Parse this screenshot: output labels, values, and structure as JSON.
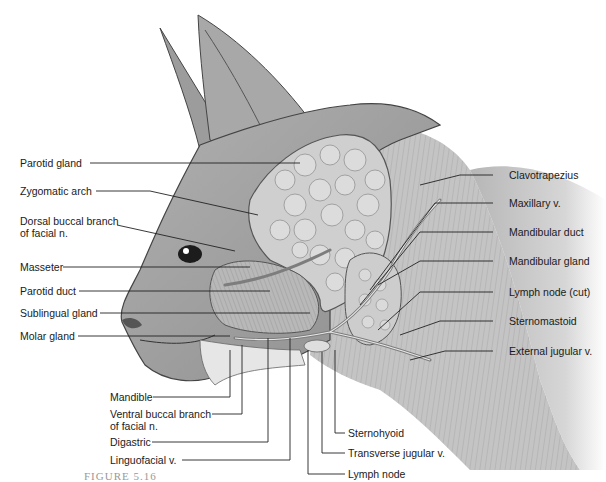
{
  "figure": {
    "caption_fragment": "FIGURE 5.16"
  },
  "labels_left": [
    {
      "id": "parotid-gland",
      "text": "Parotid gland"
    },
    {
      "id": "zygomatic-arch",
      "text": "Zygomatic arch"
    },
    {
      "id": "dorsal-buccal-branch",
      "line1": "Dorsal buccal branch",
      "line2": "of facial n."
    },
    {
      "id": "masseter",
      "text": "Masseter"
    },
    {
      "id": "parotid-duct",
      "text": "Parotid duct"
    },
    {
      "id": "sublingual-gland",
      "text": "Sublingual gland"
    },
    {
      "id": "molar-gland",
      "text": "Molar gland"
    }
  ],
  "labels_bottom_left": [
    {
      "id": "mandible",
      "text": "Mandible"
    },
    {
      "id": "ventral-buccal-branch",
      "line1": "Ventral buccal branch",
      "line2": "of facial n."
    },
    {
      "id": "digastric",
      "text": "Digastric"
    },
    {
      "id": "linguofacial-v",
      "text": "Linguofacial v."
    }
  ],
  "labels_bottom_right": [
    {
      "id": "sternohyoid",
      "text": "Sternohyoid"
    },
    {
      "id": "transverse-jugular-v",
      "text": "Transverse jugular v."
    },
    {
      "id": "lymph-node",
      "text": "Lymph node"
    }
  ],
  "labels_right": [
    {
      "id": "clavotrapezius",
      "text": "Clavotrapezius"
    },
    {
      "id": "maxillary-v",
      "text": "Maxillary v."
    },
    {
      "id": "mandibular-duct",
      "text": "Mandibular duct"
    },
    {
      "id": "mandibular-gland",
      "text": "Mandibular gland"
    },
    {
      "id": "lymph-node-cut",
      "text": "Lymph node (cut)"
    },
    {
      "id": "sternomastoid",
      "text": "Sternomastoid"
    },
    {
      "id": "external-jugular-v",
      "text": "External jugular v."
    }
  ],
  "colors": {
    "background": "#ffffff",
    "label_text": "#1a1a1a",
    "leader_line": "#222222",
    "fur_mid": "#9a9a9a",
    "fur_dark": "#5e5e5e",
    "gland": "#c9c9c9",
    "muscle": "#b4b4b4",
    "vessel": "#8a8a8a"
  }
}
